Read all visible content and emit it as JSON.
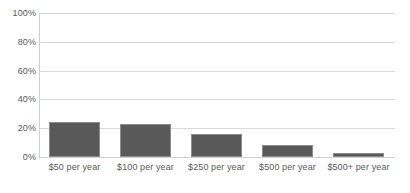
{
  "chart_data": {
    "type": "bar",
    "title": "",
    "subtitle": "",
    "xlabel": "",
    "ylabel": "",
    "categories": [
      "$50 per year",
      "$100 per year",
      "$250 per year",
      "$500 per year",
      "$500+ per year"
    ],
    "values": [
      24,
      23,
      16,
      8,
      3
    ],
    "ylim": [
      0,
      100
    ],
    "y_ticks": [
      "0%",
      "20%",
      "40%",
      "60%",
      "80%",
      "100%"
    ],
    "y_tick_values": [
      0,
      20,
      40,
      60,
      80,
      100
    ],
    "grid": true,
    "legend": false,
    "legend_position": "none",
    "series": [
      {
        "name": "Share of respondents",
        "values": [
          24,
          23,
          16,
          8,
          3
        ],
        "color": "#595959"
      }
    ]
  },
  "style": {
    "bar_fill": "#595959",
    "bar_outline": "#8c8c8c",
    "gridline_color": "#d9d9d9",
    "axis_color": "#d0d0d0",
    "tick_text_color": "#5a5a5a",
    "background": "#ffffff"
  }
}
